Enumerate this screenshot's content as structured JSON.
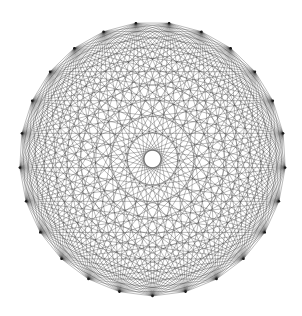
{
  "diagram": {
    "type": "complete-graph",
    "name": "K25",
    "vertex_count": 25,
    "layout": "circular",
    "center": [
      152.5,
      159
    ],
    "radius_x": 133,
    "radius_y": 137,
    "start_angle_deg": 90,
    "colors": {
      "background": "#ffffff",
      "edge": "#1a1a1a"
    },
    "edge_width": 0.35,
    "edge_opacity": 0.85
  }
}
